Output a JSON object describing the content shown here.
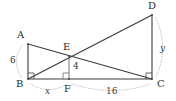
{
  "figure": {
    "stroke_color": "#3c3c3c",
    "arc_color": "#b0b0b0",
    "background": "#ffffff",
    "vertices": [
      {
        "id": "A",
        "label": "A",
        "x": 28,
        "y": 44
      },
      {
        "id": "B",
        "label": "B",
        "x": 28,
        "y": 79
      },
      {
        "id": "C",
        "label": "C",
        "x": 152,
        "y": 79
      },
      {
        "id": "D",
        "label": "D",
        "x": 152,
        "y": 15
      },
      {
        "id": "E",
        "label": "E",
        "x": 69,
        "y": 56
      },
      {
        "id": "F",
        "label": "F",
        "x": 69,
        "y": 79
      }
    ],
    "vertex_label_positions": [
      {
        "id": "A",
        "label": "A",
        "left": 17,
        "top": 30
      },
      {
        "id": "B",
        "label": "B",
        "left": 16,
        "top": 79
      },
      {
        "id": "C",
        "label": "C",
        "left": 157,
        "top": 79
      },
      {
        "id": "D",
        "label": "D",
        "left": 148,
        "top": 1
      },
      {
        "id": "E",
        "label": "E",
        "left": 63,
        "top": 42
      },
      {
        "id": "F",
        "label": "F",
        "left": 64,
        "top": 84
      }
    ],
    "segments": [
      {
        "name": "segment-AB",
        "from": "A",
        "to": "B"
      },
      {
        "name": "segment-AC",
        "from": "A",
        "to": "C"
      },
      {
        "name": "segment-BD",
        "from": "B",
        "to": "D"
      },
      {
        "name": "segment-BC",
        "from": "B",
        "to": "C"
      },
      {
        "name": "segment-DC",
        "from": "D",
        "to": "C"
      },
      {
        "name": "segment-EF",
        "from": "E",
        "to": "F"
      }
    ],
    "right_angles": [
      {
        "name": "right-angle-B",
        "at": "B"
      },
      {
        "name": "right-angle-C",
        "at": "C"
      },
      {
        "name": "right-angle-F",
        "at": "F"
      }
    ],
    "measures": [
      {
        "name": "measure-AB",
        "text": "6",
        "italic": false,
        "left": 10,
        "top": 56
      },
      {
        "name": "measure-EF",
        "text": "4",
        "italic": false,
        "left": 73,
        "top": 63
      },
      {
        "name": "measure-BF",
        "text": "x",
        "italic": true,
        "left": 44,
        "top": 87
      },
      {
        "name": "measure-FC",
        "text": "16",
        "italic": false,
        "left": 106,
        "top": 87
      },
      {
        "name": "measure-DC",
        "text": "y",
        "italic": true,
        "left": 160,
        "top": 44
      }
    ],
    "dimension_arcs": [
      {
        "name": "dimension-arc-AB",
        "path": "M 22 45 Q 11 62 22 78"
      },
      {
        "name": "dimension-arc-BF",
        "path": "M 30 84 Q 50 95 67 84"
      },
      {
        "name": "dimension-arc-FC",
        "path": "M 72 84 Q 113 97 150 84"
      },
      {
        "name": "dimension-arc-DC",
        "path": "M 156 18 Q 169 48 156 77"
      }
    ]
  }
}
